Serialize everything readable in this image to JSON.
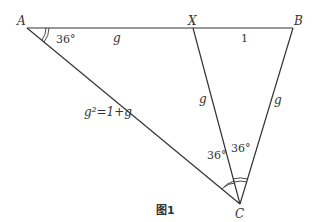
{
  "figure": {
    "caption": "图1",
    "stroke_color": "#333333",
    "vertices": {
      "A": "A",
      "B": "B",
      "X": "X",
      "C": "C"
    },
    "segments": {
      "AX": "g",
      "XB": "1",
      "XC": "g",
      "BC": "g",
      "AC": "g²=1+g"
    },
    "angles": {
      "A": "36°",
      "ACX": "36°",
      "XCB": "36°"
    }
  }
}
